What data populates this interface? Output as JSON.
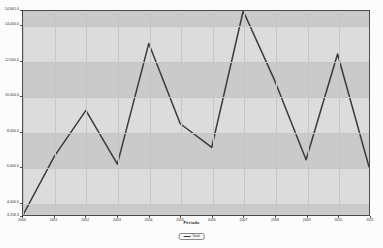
{
  "chart_data": {
    "type": "line",
    "title": "",
    "xlabel": "Periodo",
    "ylabel": "",
    "categories": [
      "2000",
      "2001",
      "2002",
      "2003",
      "2004",
      "2005",
      "2006",
      "2007",
      "2008",
      "2009",
      "2010",
      "2011"
    ],
    "series": [
      {
        "name": "Total",
        "values": [
          3258.3,
          6600.0,
          9200.0,
          6150.0,
          13000.0,
          8440.0,
          7100.0,
          14841.0,
          10900.0,
          6400.0,
          12400.0,
          6000.0
        ]
      }
    ],
    "ylim": [
      3258.3,
      14841.0
    ],
    "xlim": [
      "2000",
      "2011"
    ],
    "ytick_labels": [
      "14,841.0",
      "14,000.0",
      "12,000.0",
      "10,000.0",
      "8,000.0",
      "6,000.0",
      "4,000.0",
      "3,258.3"
    ],
    "ytick_values": [
      14841.0,
      14000.0,
      12000.0,
      10000.0,
      8000.0,
      6000.0,
      4000.0,
      3258.3
    ],
    "xtick_labels": [
      "2000",
      "2001",
      "2002",
      "2003",
      "2004",
      "2005",
      "2006",
      "2007",
      "2008",
      "2009",
      "2010",
      "2011"
    ],
    "grid": true,
    "legend_position": "bottom",
    "legend_entries": [
      "Total"
    ],
    "colors": {
      "line": "#3a3a3a",
      "plot_background": "#d8d8d8",
      "band_light": "#dcdcdc",
      "band_dark": "#cacaca",
      "grid": "#c6c6c6",
      "axis": "#4a4a4a",
      "page_background": "#fcfcfc",
      "text": "#262626"
    },
    "bands": [
      {
        "from": 3258.3,
        "to": 4000.0,
        "shade": "dark"
      },
      {
        "from": 4000.0,
        "to": 6000.0,
        "shade": "light"
      },
      {
        "from": 6000.0,
        "to": 8000.0,
        "shade": "dark"
      },
      {
        "from": 8000.0,
        "to": 10000.0,
        "shade": "light"
      },
      {
        "from": 10000.0,
        "to": 12000.0,
        "shade": "dark"
      },
      {
        "from": 12000.0,
        "to": 14000.0,
        "shade": "light"
      },
      {
        "from": 14000.0,
        "to": 14841.0,
        "shade": "dark"
      }
    ]
  }
}
